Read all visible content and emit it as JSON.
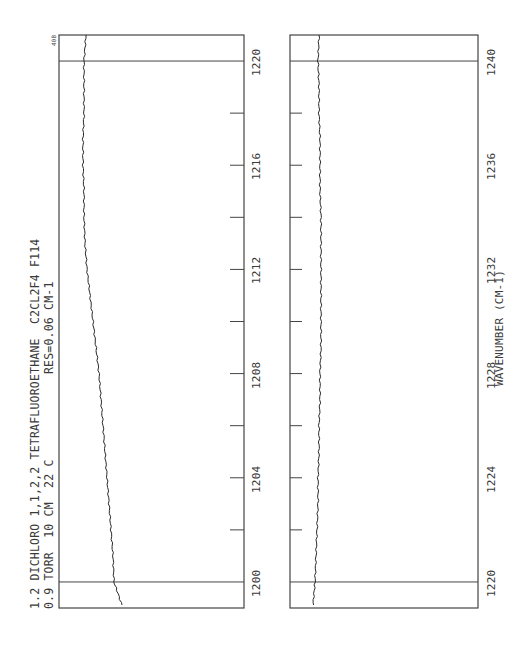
{
  "chart_data": [
    {
      "type": "line",
      "orientation": "rotated-90-ccw",
      "title": "1.2 DICHLORO 1,1,2,2 TETRAFLUOROETHANE  C2CL2F4 F114",
      "subtitle_left": "0.9 TORR  10 CM  22 C",
      "subtitle_right": "RES=0.06 CM-1",
      "corner_label": "408",
      "xlabel": "",
      "ylabel": "",
      "xlim": [
        1199,
        1221
      ],
      "tick_labels": [
        "1200",
        "1204",
        "1208",
        "1212",
        "1216",
        "1220"
      ],
      "minor_ticks_step": 2,
      "gridlines": [
        1200,
        1220
      ],
      "series": [
        {
          "name": "transmittance",
          "x": [
            1199.1,
            1200,
            1201,
            1202,
            1203,
            1204,
            1205,
            1206,
            1207,
            1208,
            1209,
            1210,
            1211,
            1212,
            1213,
            1214,
            1215,
            1216,
            1217,
            1218,
            1219,
            1220,
            1221
          ],
          "values_px_offset": [
            63,
            55,
            54,
            52,
            50,
            48,
            46,
            44,
            42,
            40,
            37,
            34,
            31,
            28,
            26,
            25,
            25,
            24,
            24,
            25,
            25,
            25,
            27
          ]
        }
      ]
    },
    {
      "type": "line",
      "orientation": "rotated-90-ccw",
      "xlabel": "WAVENUMBER (CM-1)",
      "ylabel": "",
      "xlim": [
        1219,
        1241
      ],
      "tick_labels": [
        "1220",
        "1224",
        "1228",
        "1232",
        "1236",
        "1240"
      ],
      "minor_ticks_step": 2,
      "gridlines": [
        1220,
        1240
      ],
      "series": [
        {
          "name": "transmittance",
          "x": [
            1219.1,
            1220,
            1221,
            1222,
            1223,
            1224,
            1225,
            1226,
            1227,
            1228,
            1229,
            1230,
            1231,
            1232,
            1233,
            1234,
            1235,
            1236,
            1237,
            1238,
            1239,
            1240,
            1241
          ],
          "values_px_offset": [
            23,
            25,
            26,
            27,
            28,
            28,
            29,
            29,
            30,
            30,
            31,
            31,
            31,
            31,
            31,
            31,
            30,
            30,
            30,
            29,
            29,
            28,
            29
          ]
        }
      ]
    }
  ],
  "layout": {
    "panels": [
      {
        "left": 59,
        "right": 244,
        "top": 35,
        "bottom": 608,
        "tick_side": "right"
      },
      {
        "left": 290,
        "right": 478,
        "top": 35,
        "bottom": 608,
        "tick_side": "left"
      }
    ],
    "line_color": "#444444",
    "trace_color": "#2a2a2a"
  }
}
